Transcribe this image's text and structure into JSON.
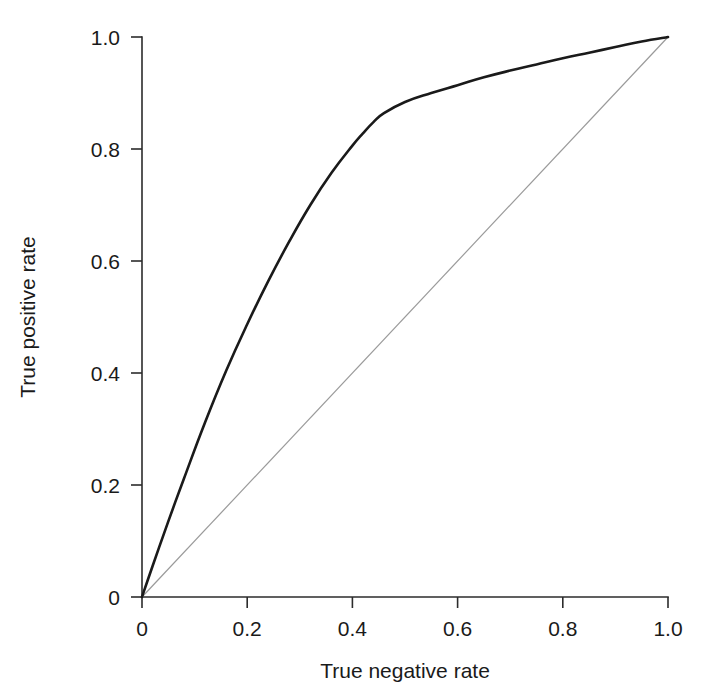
{
  "chart_data": {
    "type": "line",
    "title": "",
    "subtitle": "",
    "xlabel": "True negative rate",
    "ylabel": "True positive rate",
    "xlim": [
      0,
      1
    ],
    "ylim": [
      0,
      1
    ],
    "grid": false,
    "legend": "none",
    "x_ticks": [
      "0",
      "0.2",
      "0.4",
      "0.6",
      "0.8",
      "1.0"
    ],
    "x_tick_values": [
      0,
      0.2,
      0.4,
      0.6,
      0.8,
      1.0
    ],
    "y_ticks": [
      "0",
      "0.2",
      "0.4",
      "0.6",
      "0.8",
      "1.0"
    ],
    "y_tick_values": [
      0,
      0.2,
      0.4,
      0.6,
      0.8,
      1.0
    ],
    "series": [
      {
        "name": "ROC curve",
        "color": "#1a1a1a",
        "width": 2.6,
        "x": [
          0.0,
          0.02,
          0.05,
          0.08,
          0.12,
          0.16,
          0.2,
          0.24,
          0.28,
          0.32,
          0.36,
          0.4,
          0.42,
          0.44,
          0.46,
          0.5,
          0.55,
          0.6,
          0.65,
          0.7,
          0.75,
          0.8,
          0.85,
          0.9,
          0.95,
          1.0
        ],
        "y": [
          0.0,
          0.055,
          0.135,
          0.212,
          0.312,
          0.404,
          0.487,
          0.564,
          0.635,
          0.7,
          0.757,
          0.806,
          0.828,
          0.848,
          0.864,
          0.884,
          0.9,
          0.914,
          0.928,
          0.94,
          0.951,
          0.962,
          0.972,
          0.982,
          0.992,
          1.0
        ]
      },
      {
        "name": "Chance diagonal",
        "color": "#9a9a9a",
        "width": 1.2,
        "x": [
          0.0,
          1.0
        ],
        "y": [
          0.0,
          1.0
        ]
      }
    ]
  },
  "axes": {
    "x_axis_name": "True negative rate",
    "y_axis_name": "True positive rate"
  }
}
